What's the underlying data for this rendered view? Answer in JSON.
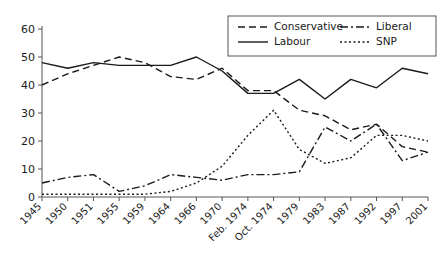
{
  "chart_data": {
    "type": "line",
    "title": "",
    "subtitle": "",
    "xlabel": "",
    "ylabel": "",
    "ylim": [
      0,
      60
    ],
    "ytick_values": [
      0,
      10,
      20,
      30,
      40,
      50,
      60
    ],
    "ytick_labels": [
      "0",
      "10",
      "20",
      "30",
      "40",
      "50",
      "60"
    ],
    "grid": false,
    "legend_position": "top-right",
    "categories": [
      "1945",
      "1950",
      "1951",
      "1955",
      "1959",
      "1964",
      "1966",
      "1970",
      "Feb. 1974",
      "Oct. 1974",
      "1979",
      "1983",
      "1987",
      "1992",
      "1997",
      "2001"
    ],
    "series": [
      {
        "name": "Conservative",
        "style": "dashed",
        "dash": "7,4",
        "values": [
          40,
          44,
          47,
          50,
          48,
          43,
          42,
          46,
          38,
          38,
          31,
          29,
          24,
          26,
          18,
          16
        ]
      },
      {
        "name": "Labour",
        "style": "solid",
        "dash": "",
        "values": [
          48,
          46,
          48,
          47,
          47,
          47,
          50,
          45,
          37,
          37,
          42,
          35,
          42,
          39,
          46,
          44
        ]
      },
      {
        "name": "Liberal",
        "style": "dash-dot",
        "dash": "8,3,2,3",
        "values": [
          5,
          7,
          8,
          2,
          4,
          8,
          7,
          6,
          8,
          8,
          9,
          25,
          20,
          26,
          13,
          16
        ]
      },
      {
        "name": "SNP",
        "style": "dotted",
        "dash": "2,2.5",
        "values": [
          1,
          1,
          1,
          1,
          1,
          2,
          5,
          11,
          22,
          31,
          17,
          12,
          14,
          22,
          22,
          20
        ]
      }
    ]
  },
  "legend": {
    "entries": [
      {
        "label": "Conservative"
      },
      {
        "label": "Liberal"
      },
      {
        "label": "Labour"
      },
      {
        "label": "SNP"
      }
    ]
  }
}
